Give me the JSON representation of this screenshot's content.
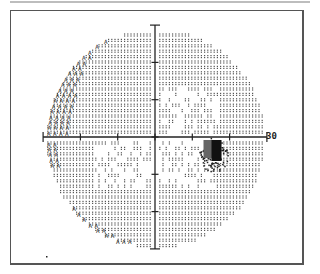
{
  "chart_data": {
    "type": "heatmap",
    "xlabel": "",
    "ylabel": "",
    "axis_range_degrees": [
      -30,
      30
    ],
    "tick_interval_degrees": 10,
    "axis_end_label": "30",
    "grid": false,
    "legend": null,
    "regions": [
      {
        "name": "normal sensitivity",
        "tone": "light dot pattern",
        "area": "most of field"
      },
      {
        "name": "reduced sensitivity (sparser dots)",
        "area": "central/nasal zones"
      },
      {
        "name": "edge depression (A glyphs)",
        "area": "upper-left and lower-left periphery"
      },
      {
        "name": "blind spot (dense/black)",
        "area": "right of center, just below horizontal meridian",
        "approx_x_deg": [
          13,
          20
        ],
        "approx_y_deg": [
          -1,
          -9
        ]
      }
    ]
  },
  "colors": {
    "ink": "#222222",
    "dots": "#555555",
    "frame": "#555555",
    "blindspot_dark": "#111111",
    "blindspot_gray": "#666666"
  },
  "labels": {
    "axis_30": "30"
  },
  "geometry": {
    "cx": 155,
    "cy": 137,
    "px_per_10deg": 37.3,
    "radius": 111
  }
}
